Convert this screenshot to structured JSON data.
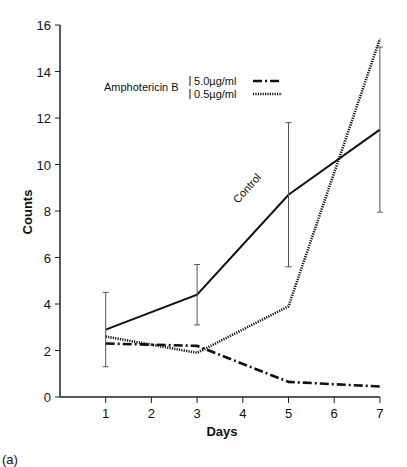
{
  "chart_data": {
    "type": "line",
    "title": "",
    "xlabel": "Days",
    "ylabel": "Counts",
    "panel_label": "(a)",
    "x": [
      1,
      3,
      5,
      7
    ],
    "xticks": [
      1,
      2,
      3,
      4,
      5,
      6,
      7
    ],
    "yticks": [
      0,
      2,
      4,
      6,
      8,
      10,
      12,
      14,
      16
    ],
    "xlim": [
      0,
      7
    ],
    "ylim": [
      0,
      16
    ],
    "grid": false,
    "legend_title": "Amphotericin B",
    "series": [
      {
        "name": "Control",
        "style": "solid",
        "values": [
          2.9,
          4.4,
          8.7,
          11.5
        ],
        "error_low": [
          1.3,
          3.1,
          5.6,
          7.95
        ],
        "error_high": [
          4.5,
          5.7,
          11.8,
          15.05
        ]
      },
      {
        "name": "5.0 µg/ml",
        "style": "dash-dot",
        "values": [
          2.3,
          2.2,
          0.65,
          0.45
        ]
      },
      {
        "name": "0.5 µg/ml",
        "style": "dotted",
        "values": [
          2.6,
          1.9,
          3.9,
          15.4
        ]
      }
    ],
    "annotations": [
      "Control"
    ]
  },
  "legend": {
    "title": "Amphotericin B",
    "items": [
      "5.0µg/ml",
      "0.5µg/ml"
    ]
  }
}
